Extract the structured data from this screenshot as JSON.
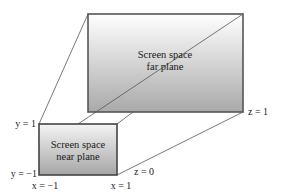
{
  "far_plane": {
    "line1": "Screen space",
    "line2": "far plane",
    "corner_label": "z = 1"
  },
  "near_plane": {
    "line1": "Screen space",
    "line2": "near plane",
    "z_label": "z = 0"
  },
  "axis_labels": {
    "y_top": "y = 1",
    "y_bottom": "y = −1",
    "x_left": "x = −1",
    "x_right": "x = 1"
  },
  "colors": {
    "gradient_top": "#ffffff",
    "gradient_bottom": "#a8a8a8",
    "stroke": "#444444"
  }
}
